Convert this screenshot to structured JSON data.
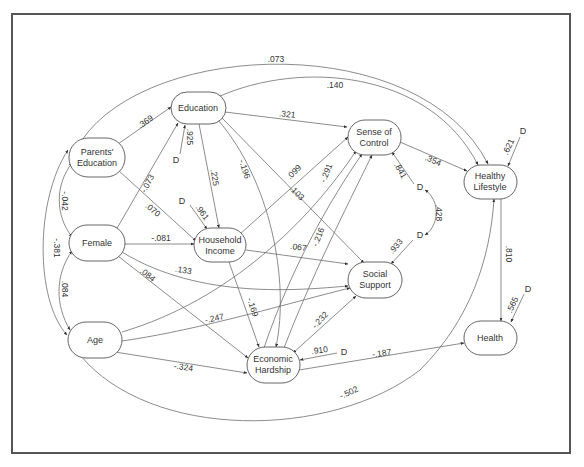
{
  "diagram": {
    "type": "structural-equation-path-model",
    "nodes": [
      {
        "id": "parents_education",
        "label": [
          "Parents'",
          "Education"
        ],
        "cx": 97,
        "cy": 157,
        "rx": 28,
        "ry": 19
      },
      {
        "id": "female",
        "label": [
          "Female"
        ],
        "cx": 97,
        "cy": 243,
        "rx": 28,
        "ry": 18
      },
      {
        "id": "age",
        "label": [
          "Age"
        ],
        "cx": 95,
        "cy": 340,
        "rx": 27,
        "ry": 18
      },
      {
        "id": "education",
        "label": [
          "Education"
        ],
        "cx": 198,
        "cy": 108,
        "rx": 27,
        "ry": 16
      },
      {
        "id": "household_income",
        "label": [
          "Household",
          "Income"
        ],
        "cx": 220,
        "cy": 245,
        "rx": 26,
        "ry": 17
      },
      {
        "id": "sense_of_control",
        "label": [
          "Sense of",
          "Control"
        ],
        "cx": 374,
        "cy": 137,
        "rx": 26,
        "ry": 17
      },
      {
        "id": "social_support",
        "label": [
          "Social",
          "Support"
        ],
        "cx": 375,
        "cy": 280,
        "rx": 27,
        "ry": 18
      },
      {
        "id": "economic_hardship",
        "label": [
          "Economic",
          "Hardship"
        ],
        "cx": 273,
        "cy": 365,
        "rx": 26,
        "ry": 18
      },
      {
        "id": "healthy_lifestyle",
        "label": [
          "Healthy",
          "Lifestyle"
        ],
        "cx": 490,
        "cy": 181,
        "rx": 26,
        "ry": 17
      },
      {
        "id": "health",
        "label": [
          "Health"
        ],
        "cx": 490,
        "cy": 338,
        "rx": 26,
        "ry": 17
      }
    ],
    "disturbances": [
      {
        "id": "d_education",
        "label": "D",
        "x": 176,
        "y": 160,
        "target": "education",
        "coef": ".925"
      },
      {
        "id": "d_income",
        "label": "D",
        "x": 181,
        "y": 201,
        "target": "household_income",
        "coef": ".961"
      },
      {
        "id": "d_control",
        "label": "D",
        "x": 419,
        "y": 188,
        "target": "sense_of_control",
        "coef": ".841"
      },
      {
        "id": "d_support",
        "label": "D",
        "x": 419,
        "y": 236,
        "target": "social_support",
        "coef": ".933"
      },
      {
        "id": "d_hardship",
        "label": "D",
        "x": 344,
        "y": 352,
        "target": "economic_hardship",
        "coef": ".910"
      },
      {
        "id": "d_lifestyle",
        "label": "D",
        "x": 523,
        "y": 132,
        "target": "healthy_lifestyle",
        "coef": ".621"
      },
      {
        "id": "d_health",
        "label": "D",
        "x": 528,
        "y": 290,
        "target": "health",
        "coef": ".565"
      }
    ],
    "paths": [
      {
        "from": "parents_education",
        "to": "education",
        "coef": ".369"
      },
      {
        "from": "parents_education",
        "to": "household_income",
        "coef": ".070"
      },
      {
        "from": "parents_education",
        "to": "healthy_lifestyle",
        "coef": ".073"
      },
      {
        "from": "female",
        "to": "education",
        "coef": "-.073"
      },
      {
        "from": "female",
        "to": "household_income",
        "coef": "-.081"
      },
      {
        "from": "female",
        "to": "social_support",
        "coef": ".133"
      },
      {
        "from": "female",
        "to": "economic_hardship",
        "coef": ".084"
      },
      {
        "from": "age",
        "to": "social_support",
        "coef": "-.247"
      },
      {
        "from": "age",
        "to": "economic_hardship",
        "coef": "-.324"
      },
      {
        "from": "age",
        "to": "healthy_lifestyle",
        "coef": "-.502"
      },
      {
        "from": "age",
        "to": "sense_of_control",
        "coef": ""
      },
      {
        "from": "education",
        "to": "sense_of_control",
        "coef": ".321"
      },
      {
        "from": "education",
        "to": "household_income",
        "coef": ".225"
      },
      {
        "from": "education",
        "to": "economic_hardship",
        "coef": "-.196"
      },
      {
        "from": "education",
        "to": "social_support",
        "coef": ".103"
      },
      {
        "from": "education",
        "to": "healthy_lifestyle",
        "coef": ".140"
      },
      {
        "from": "household_income",
        "to": "sense_of_control",
        "coef": ".099"
      },
      {
        "from": "household_income",
        "to": "social_support",
        "coef": ".067"
      },
      {
        "from": "household_income",
        "to": "economic_hardship",
        "coef": "-.169"
      },
      {
        "from": "economic_hardship",
        "to": "sense_of_control",
        "coef": "-.291"
      },
      {
        "from": "economic_hardship",
        "to": "sense_of_control",
        "coef": "-.216"
      },
      {
        "from": "economic_hardship",
        "to": "social_support",
        "coef": "-.232"
      },
      {
        "from": "economic_hardship",
        "to": "health",
        "coef": "-.187"
      },
      {
        "from": "sense_of_control",
        "to": "healthy_lifestyle",
        "coef": ".354"
      },
      {
        "from": "healthy_lifestyle",
        "to": "health",
        "coef": ".810"
      }
    ],
    "correlations": [
      {
        "between": [
          "parents_education",
          "female"
        ],
        "coef": "-.042"
      },
      {
        "between": [
          "female",
          "age"
        ],
        "coef": ".084"
      },
      {
        "between": [
          "parents_education",
          "age"
        ],
        "coef": "-.381"
      },
      {
        "between": [
          "d_control",
          "d_support"
        ],
        "coef": ".428"
      }
    ]
  },
  "labels": {
    "c_369": ".369",
    "c_070": ".070",
    "c_073top": ".073",
    "c_m073": "-.073",
    "c_m081": "-.081",
    "c_133": ".133",
    "c_084f": ".084",
    "c_m247": "-.247",
    "c_m324": "-.324",
    "c_m502": "-.502",
    "c_321": ".321",
    "c_225": ".225",
    "c_m196": "-.196",
    "c_103": ".103",
    "c_140": ".140",
    "c_099": ".099",
    "c_067": ".067",
    "c_m169": "-.169",
    "c_m291": "-.291",
    "c_m216": "-.216",
    "c_m232": "-.232",
    "c_m187": "-.187",
    "c_354": ".354",
    "c_810": ".810",
    "c_m042": "-.042",
    "c_084c": ".084",
    "c_m381": "-.381",
    "c_428": ".428",
    "c_925": ".925",
    "c_961": ".961",
    "c_841": ".841",
    "c_933": ".933",
    "c_910": ".910",
    "c_621": ".621",
    "c_565": ".565",
    "D": "D"
  },
  "node_text": {
    "parents_education": {
      "l1": "Parents'",
      "l2": "Education"
    },
    "female": {
      "l1": "Female"
    },
    "age": {
      "l1": "Age"
    },
    "education": {
      "l1": "Education"
    },
    "household_income": {
      "l1": "Household",
      "l2": "Income"
    },
    "sense_of_control": {
      "l1": "Sense of",
      "l2": "Control"
    },
    "social_support": {
      "l1": "Social",
      "l2": "Support"
    },
    "economic_hardship": {
      "l1": "Economic",
      "l2": "Hardship"
    },
    "healthy_lifestyle": {
      "l1": "Healthy",
      "l2": "Lifestyle"
    },
    "health": {
      "l1": "Health"
    }
  },
  "colors": {
    "line": "#666666",
    "text": "#333333",
    "frame": "#555555",
    "background": "#ffffff"
  }
}
